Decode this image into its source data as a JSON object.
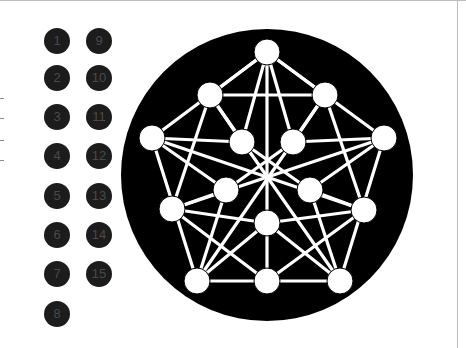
{
  "labels": {
    "column1": [
      "1",
      "2",
      "3",
      "4",
      "5",
      "6",
      "7",
      "8"
    ],
    "column2": [
      "9",
      "10",
      "11",
      "12",
      "13",
      "14",
      "15"
    ]
  },
  "colors": {
    "badge_fill": "#1c1c1c",
    "badge_text": "#4a4a4a",
    "disc_fill": "#000000",
    "node_fill": "#ffffff",
    "edge_color": "#ffffff"
  },
  "graph": {
    "node_count": 15,
    "edge_style": "white lines on black disc"
  }
}
